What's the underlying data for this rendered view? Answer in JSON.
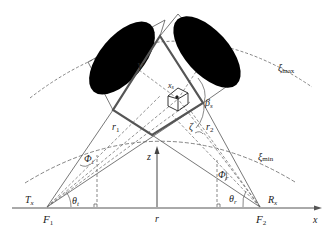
{
  "diagram": {
    "type": "bistatic-geometry",
    "colors": {
      "line": "#555555",
      "square": "#555555",
      "ellipse": "#000000",
      "dashed": "#666666",
      "background": "#ffffff"
    },
    "labels": {
      "V": "V",
      "xi_max": "ξ",
      "xi_max_sub": "max",
      "xi_min": "ξ",
      "xi_min_sub": "min",
      "beta": "β",
      "beta_sub": "s",
      "zeta": "ζ",
      "r1": "r",
      "r1_sub": "1",
      "r2": "r",
      "r2_sub": "2",
      "phi_t": "Φ",
      "phi_t_sub": "t",
      "phi_r": "Φ",
      "phi_r_sub": "r",
      "theta_t": "θ",
      "theta_t_sub": "t",
      "theta_r": "θ",
      "theta_r_sub": "r",
      "Tx": "T",
      "Tx_sub": "x",
      "Rx": "R",
      "Rx_sub": "x",
      "F1": "F",
      "F1_sub": "1",
      "F2": "F",
      "F2_sub": "2",
      "z": "z",
      "r": "r",
      "x": "x",
      "xs": "x",
      "xs_sub": "s"
    }
  }
}
